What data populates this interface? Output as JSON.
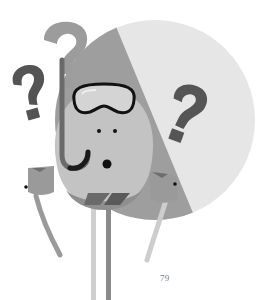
{
  "page": {
    "page_number": "79"
  },
  "illustration": {
    "subject": "snorkel-mask character surrounded by question marks",
    "elements": [
      "large-split-circle",
      "question-mark-left-dark",
      "question-mark-back-light",
      "question-mark-right-dark",
      "character-body",
      "dive-mask",
      "snorkel",
      "eyes",
      "mouth",
      "armband-left",
      "armband-right",
      "arms",
      "legs"
    ],
    "colors": {
      "background": "#ffffff",
      "circle_light": "#e4e4e4",
      "circle_mid": "#9c9c9c",
      "body": "#c2c2c2",
      "body_shadow": "#8e8e8e",
      "question_dark": "#555555",
      "question_light": "#9a9a9a",
      "outline": "#111111",
      "limb_light": "#cfcfcf",
      "limb_dark": "#8a8a8a"
    }
  }
}
